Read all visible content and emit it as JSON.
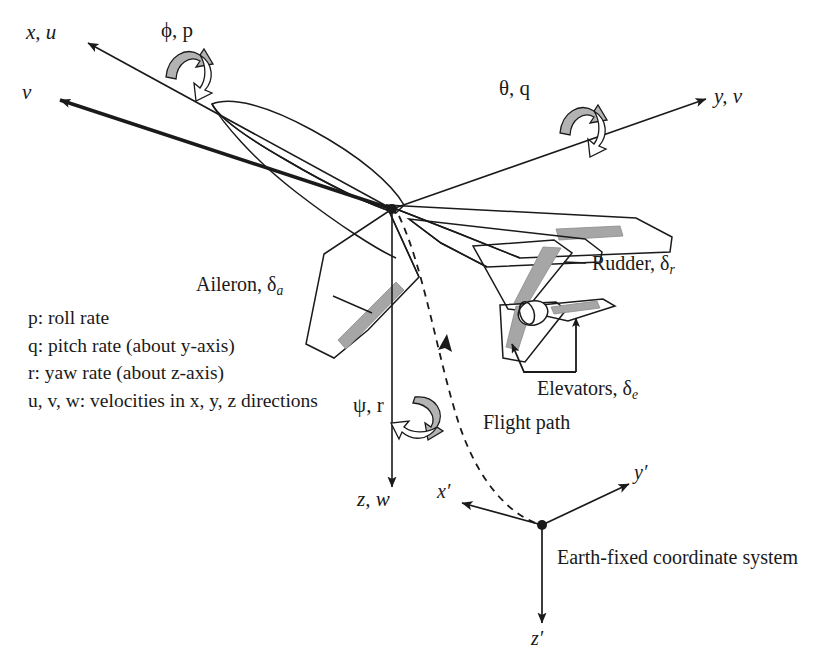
{
  "figure": {
    "background_color": "#ffffff",
    "line_color": "#1a1a1a",
    "control_surface_color": "#a6a6a6",
    "rotation_arrow_fill": "#b3b3b3"
  },
  "body_axes": {
    "x_axis_label": "x, u",
    "y_axis_label": "y, v",
    "z_axis_label": "z, w",
    "velocity_vector_label": "v"
  },
  "rotations": {
    "roll": "ϕ, p",
    "pitch": "θ, q",
    "yaw": "ψ, r"
  },
  "control_surfaces": {
    "aileron": {
      "name": "Aileron",
      "symbol": "δ",
      "subscript": "a"
    },
    "rudder": {
      "name": "Rudder",
      "symbol": "δ",
      "subscript": "r"
    },
    "elevators": {
      "name": "Elevators",
      "symbol": "δ",
      "subscript": "e"
    }
  },
  "flight_path": {
    "label": "Flight path"
  },
  "earth_axes": {
    "x_label": "x′",
    "y_label": "y′",
    "z_label": "z′",
    "caption": "Earth-fixed coordinate system"
  },
  "legend": {
    "lines": [
      "p: roll rate",
      "q: pitch rate (about y-axis)",
      "r: yaw rate (about z-axis)",
      "u, v, w: velocities in x, y, z directions"
    ]
  }
}
